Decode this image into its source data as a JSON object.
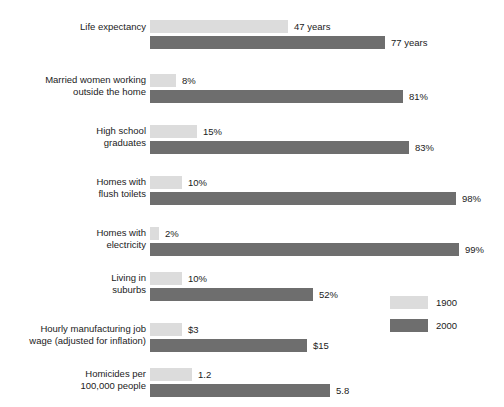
{
  "chart_data": {
    "type": "bar",
    "orientation": "horizontal",
    "title": "",
    "xlabel": "",
    "ylabel": "",
    "grid": false,
    "legend_position": "right-middle",
    "categories": [
      "Life expectancy",
      "Married women working\noutside the home",
      "High school\ngraduates",
      "Homes with\nflush toilets",
      "Homes with\nelectricity",
      "Living in\nsuburbs",
      "Hourly manufacturing job\nwage (adjusted for inflation)",
      "Homicides per\n100,000 people"
    ],
    "series": [
      {
        "name": "1900",
        "color": "#dcdcdc",
        "values": [
          47,
          8,
          15,
          10,
          2,
          10,
          3,
          1.2
        ],
        "labels": [
          "47 years",
          "8%",
          "15%",
          "10%",
          "2%",
          "10%",
          "$3",
          "1.2"
        ]
      },
      {
        "name": "2000",
        "color": "#6e6e6e",
        "values": [
          77,
          81,
          83,
          98,
          99,
          52,
          15,
          5.8
        ],
        "labels": [
          "77 years",
          "81%",
          "83%",
          "98%",
          "99%",
          "52%",
          "$15",
          "5.8"
        ]
      }
    ],
    "rows": [
      {
        "label": "Life expectancy",
        "unit": "years",
        "y1900": {
          "value": 47,
          "label": "47 years",
          "bar_px": 138
        },
        "y2000": {
          "value": 77,
          "label": "77 years",
          "bar_px": 235
        }
      },
      {
        "label": "Married women working\noutside the home",
        "unit": "%",
        "y1900": {
          "value": 8,
          "label": "8%",
          "bar_px": 26
        },
        "y2000": {
          "value": 81,
          "label": "81%",
          "bar_px": 253
        }
      },
      {
        "label": "High school\ngraduates",
        "unit": "%",
        "y1900": {
          "value": 15,
          "label": "15%",
          "bar_px": 47
        },
        "y2000": {
          "value": 83,
          "label": "83%",
          "bar_px": 259
        }
      },
      {
        "label": "Homes with\nflush toilets",
        "unit": "%",
        "y1900": {
          "value": 10,
          "label": "10%",
          "bar_px": 32
        },
        "y2000": {
          "value": 98,
          "label": "98%",
          "bar_px": 306
        }
      },
      {
        "label": "Homes with\nelectricity",
        "unit": "%",
        "y1900": {
          "value": 2,
          "label": "2%",
          "bar_px": 9
        },
        "y2000": {
          "value": 99,
          "label": "99%",
          "bar_px": 309
        }
      },
      {
        "label": "Living in\nsuburbs",
        "unit": "%",
        "y1900": {
          "value": 10,
          "label": "10%",
          "bar_px": 32
        },
        "y2000": {
          "value": 52,
          "label": "52%",
          "bar_px": 163
        }
      },
      {
        "label": "Hourly manufacturing job\nwage (adjusted for inflation)",
        "unit": "$",
        "y1900": {
          "value": 3,
          "label": "$3",
          "bar_px": 32
        },
        "y2000": {
          "value": 15,
          "label": "$15",
          "bar_px": 157
        }
      },
      {
        "label": "Homicides per\n100,000 people",
        "unit": "per 100,000",
        "y1900": {
          "value": 1.2,
          "label": "1.2",
          "bar_px": 42
        },
        "y2000": {
          "value": 5.8,
          "label": "5.8",
          "bar_px": 180
        }
      }
    ]
  },
  "legend": {
    "items": [
      {
        "label": "1900",
        "color": "#dcdcdc"
      },
      {
        "label": "2000",
        "color": "#6e6e6e"
      }
    ]
  },
  "colors": {
    "series_1900": "#dcdcdc",
    "series_2000": "#6e6e6e",
    "text": "#1b1b1b",
    "background": "#ffffff"
  }
}
